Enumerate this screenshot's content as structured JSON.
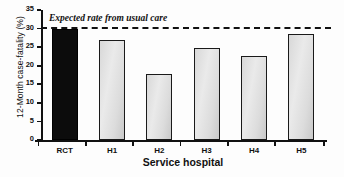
{
  "chart_data": {
    "type": "bar",
    "title": "",
    "xlabel": "Service hospital",
    "ylabel": "12-Month case-fatality (%)",
    "categories": [
      "RCT",
      "H1",
      "H2",
      "H3",
      "H4",
      "H5"
    ],
    "values": [
      30.0,
      26.8,
      17.8,
      24.7,
      22.7,
      28.5
    ],
    "ylim": [
      0,
      35
    ],
    "yticks": [
      0,
      5,
      10,
      15,
      20,
      25,
      30,
      35
    ],
    "ytick_labels": [
      "0",
      "5",
      "10",
      "15",
      "20",
      "25",
      "30",
      "35"
    ],
    "grid": false,
    "legend": false,
    "annotations": [
      {
        "name": "expected-rate-line",
        "text": "Expected rate from usual care",
        "value": 30.3,
        "style": "dashed-horizontal-line"
      }
    ],
    "bar_styles": [
      {
        "category": "RCT",
        "fill": "#0c0c0c",
        "edge": "#000000"
      },
      {
        "category": "H1",
        "fill": "#dcdcdc",
        "edge": "#1a1a1a"
      },
      {
        "category": "H2",
        "fill": "#dcdcdc",
        "edge": "#1a1a1a"
      },
      {
        "category": "H3",
        "fill": "#dcdcdc",
        "edge": "#1a1a1a"
      },
      {
        "category": "H4",
        "fill": "#dcdcdc",
        "edge": "#1a1a1a"
      },
      {
        "category": "H5",
        "fill": "#dcdcdc",
        "edge": "#1a1a1a"
      }
    ]
  }
}
